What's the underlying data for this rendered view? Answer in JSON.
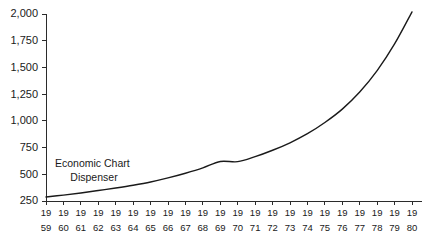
{
  "chart_data": {
    "type": "line",
    "title": "",
    "subtitle": "",
    "xlabel": "",
    "ylabel": "",
    "grid": false,
    "legend_position": "none",
    "ylim": [
      250,
      2000
    ],
    "ytick_labels": [
      "2,000",
      "1,750",
      "1,500",
      "1,250",
      "1,000",
      "750",
      "500",
      "250"
    ],
    "ytick_values": [
      2000,
      1750,
      1500,
      1250,
      1000,
      750,
      500,
      250
    ],
    "xtick_labels": [
      {
        "top": "19",
        "bottom": "59"
      },
      {
        "top": "19",
        "bottom": "60"
      },
      {
        "top": "19",
        "bottom": "61"
      },
      {
        "top": "19",
        "bottom": "62"
      },
      {
        "top": "19",
        "bottom": "63"
      },
      {
        "top": "19",
        "bottom": "64"
      },
      {
        "top": "19",
        "bottom": "65"
      },
      {
        "top": "19",
        "bottom": "66"
      },
      {
        "top": "19",
        "bottom": "67"
      },
      {
        "top": "19",
        "bottom": "68"
      },
      {
        "top": "19",
        "bottom": "69"
      },
      {
        "top": "19",
        "bottom": "70"
      },
      {
        "top": "19",
        "bottom": "71"
      },
      {
        "top": "19",
        "bottom": "72"
      },
      {
        "top": "19",
        "bottom": "73"
      },
      {
        "top": "19",
        "bottom": "74"
      },
      {
        "top": "19",
        "bottom": "75"
      },
      {
        "top": "19",
        "bottom": "76"
      },
      {
        "top": "19",
        "bottom": "77"
      },
      {
        "top": "19",
        "bottom": "78"
      },
      {
        "top": "19",
        "bottom": "79"
      },
      {
        "top": "19",
        "bottom": "80"
      }
    ],
    "categories": [
      1959,
      1960,
      1961,
      1962,
      1963,
      1964,
      1965,
      1966,
      1967,
      1968,
      1969,
      1970,
      1971,
      1972,
      1973,
      1974,
      1975,
      1976,
      1977,
      1978,
      1979,
      1980
    ],
    "series": [
      {
        "name": "Economic Chart Dispenser",
        "color": "#1a1a1a",
        "values": [
          288,
          305,
          325,
          348,
          372,
          398,
          428,
          466,
          510,
          560,
          620,
          618,
          665,
          725,
          795,
          880,
          985,
          1110,
          1270,
          1470,
          1720,
          2020
        ]
      }
    ],
    "annotations": [
      {
        "name": "series-annotation",
        "line1": "Economic Chart",
        "line2": "Dispenser"
      }
    ],
    "colors": {
      "line": "#1a1a1a",
      "axis": "#2b2b2b",
      "background": "#ffffff",
      "text": "#1a1a1a"
    }
  },
  "layout": {
    "plot_left": 46,
    "plot_right": 412,
    "plot_top": 14,
    "plot_bottom": 201,
    "tick_length": 4,
    "xlabel_row1_y": 216,
    "xlabel_row2_y": 231
  }
}
